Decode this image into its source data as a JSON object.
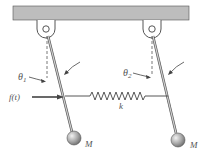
{
  "diagram": {
    "labels": {
      "theta1": "θ",
      "theta1_sub": "1",
      "theta2": "θ",
      "theta2_sub": "2",
      "force": "f(t)",
      "spring": "k",
      "mass_left": "M",
      "mass_right": "M"
    },
    "colors": {
      "ceiling": "#b9b9b9",
      "rod": "#9a9a9a",
      "mass": "#9d9d9d",
      "line": "#444444"
    }
  }
}
